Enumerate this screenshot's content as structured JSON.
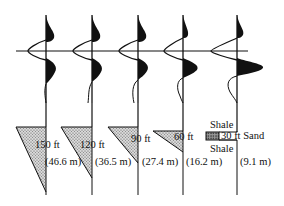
{
  "figure": {
    "type": "seismic-wedge-model",
    "reference_line": "zero-time axis",
    "colors": {
      "ink": "#111111",
      "sand_fill": "#b8b8b8"
    }
  },
  "traces": [
    {
      "id": "t1",
      "thickness_ft": "150 ft",
      "thickness_m": "(46.6 m)"
    },
    {
      "id": "t2",
      "thickness_ft": "120 ft",
      "thickness_m": "(36.5 m)"
    },
    {
      "id": "t3",
      "thickness_ft": "90 ft",
      "thickness_m": "(27.4 m)"
    },
    {
      "id": "t4",
      "thickness_ft": "60 ft",
      "thickness_m": "(16.2 m)"
    },
    {
      "id": "t5",
      "thickness_ft": "30 ft Sand",
      "thickness_m": "(9.1 m)"
    }
  ],
  "legend": {
    "upper_unit": "Shale",
    "lower_unit": "Shale"
  }
}
